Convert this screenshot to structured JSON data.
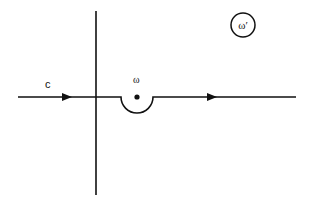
{
  "diagram": {
    "type": "contour-integration-path",
    "labels": {
      "contour": "c",
      "pole": "ω",
      "plane": "ω′"
    },
    "colors": {
      "stroke": "#111111",
      "background": "#ffffff"
    },
    "geometry": {
      "real_axis_y": 97,
      "real_axis_x_range": [
        18,
        296
      ],
      "imag_axis_x": 96,
      "imag_axis_y_range": [
        11,
        195
      ],
      "indent_center": [
        137,
        97
      ],
      "indent_radius": 16,
      "indent_direction": "below",
      "arrow_positions_x": [
        68,
        213
      ],
      "arrow_direction": "right",
      "plane_label_circle_center": [
        243,
        25
      ],
      "plane_label_circle_radius": 13
    }
  }
}
